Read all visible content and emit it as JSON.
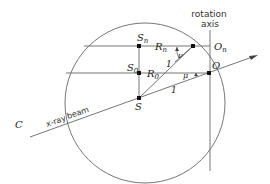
{
  "diagram": {
    "type": "geometric-construction",
    "labels": {
      "rotation_axis_line1": "rotation",
      "rotation_axis_line2": "axis",
      "S_n": "S",
      "S_n_sub": "n",
      "S_0": "S",
      "S_0_sub": "0",
      "S": "S",
      "R_n": "R",
      "R_n_sub": "n",
      "R_0": "R",
      "R_0_sub": "0",
      "O_n": "O",
      "O_n_sub": "n",
      "O": "O",
      "C": "C",
      "nu": "ν",
      "mu": "μ",
      "one_upper": "1",
      "one_lower": "1",
      "xray_beam_1": "x-ray",
      "xray_beam_2": "beam"
    },
    "colors": {
      "line": "#555555",
      "point": "#111111",
      "text": "#222222"
    }
  }
}
